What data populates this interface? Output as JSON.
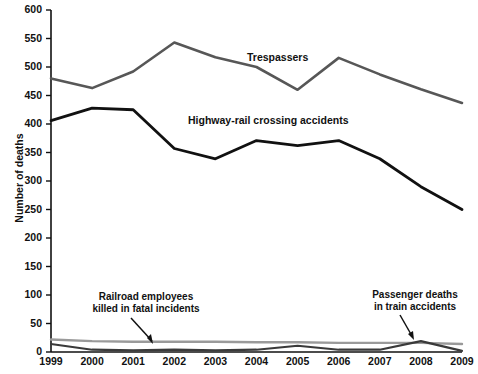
{
  "chart_data": {
    "type": "line",
    "title": "",
    "subtitle": "",
    "xlabel": "",
    "ylabel": "Number of deaths",
    "x": [
      1999,
      2000,
      2001,
      2002,
      2003,
      2004,
      2005,
      2006,
      2007,
      2008,
      2009
    ],
    "categories": [
      "1999",
      "2000",
      "2001",
      "2002",
      "2003",
      "2004",
      "2005",
      "2006",
      "2007",
      "2008",
      "2009"
    ],
    "xlim": [
      1999,
      2009
    ],
    "ylim": [
      0,
      600
    ],
    "ytick_labels": [
      "0",
      "50",
      "100",
      "150",
      "200",
      "250",
      "300",
      "350",
      "400",
      "450",
      "500",
      "550",
      "600"
    ],
    "ytick_values": [
      0,
      50,
      100,
      150,
      200,
      250,
      300,
      350,
      400,
      450,
      500,
      550,
      600
    ],
    "grid": false,
    "legend": "inline-labels",
    "series": [
      {
        "name": "Trespassers",
        "color": "#575757",
        "values": [
          480,
          463,
          492,
          543,
          517,
          500,
          460,
          516,
          487,
          461,
          437
        ],
        "label_text": "Trespassers"
      },
      {
        "name": "Highway-rail crossing accidents",
        "color": "#111111",
        "values": [
          406,
          428,
          425,
          357,
          339,
          371,
          362,
          371,
          339,
          290,
          250
        ],
        "label_text": "Highway-rail crossing accidents"
      },
      {
        "name": "Railroad employees killed in fatal incidents",
        "color": "#9a9a9a",
        "values": [
          22,
          19,
          18,
          18,
          18,
          17,
          17,
          16,
          16,
          16,
          14
        ],
        "label_text": "Railroad employees\nkilled in fatal incidents"
      },
      {
        "name": "Passenger deaths in train accidents",
        "color": "#3a3a3a",
        "values": [
          14,
          4,
          3,
          4,
          3,
          4,
          11,
          4,
          4,
          19,
          2
        ],
        "label_text": "Passenger deaths\nin train accidents"
      }
    ],
    "annotations": [
      {
        "id": "trespassers-label",
        "text": "Trespassers",
        "x_px": 247,
        "y_px": 58
      },
      {
        "id": "highway-rail-label",
        "text": "Highway-rail crossing accidents",
        "x_px": 188,
        "y_px": 121
      },
      {
        "id": "railroad-employees-callout",
        "line1": "Railroad employees",
        "line2": "killed in fatal incidents",
        "x_px": 80,
        "y_px": 297
      },
      {
        "id": "passenger-deaths-callout",
        "line1": "Passenger deaths",
        "line2": "in train accidents",
        "x_px": 363,
        "y_px": 295
      }
    ]
  },
  "axis": {
    "y_title": "Number of deaths",
    "y_ticks": [
      "600",
      "550",
      "500",
      "450",
      "400",
      "350",
      "300",
      "250",
      "200",
      "150",
      "100",
      "50",
      "0"
    ],
    "x_ticks": [
      "1999",
      "2000",
      "2001",
      "2002",
      "2003",
      "2004",
      "2005",
      "2006",
      "2007",
      "2008",
      "2009"
    ]
  },
  "labels": {
    "trespassers": "Trespassers",
    "highway_rail": "Highway-rail crossing accidents",
    "employees_line1": "Railroad employees",
    "employees_line2": "killed in fatal incidents",
    "passengers_line1": "Passenger deaths",
    "passengers_line2": "in train accidents"
  },
  "colors": {
    "trespassers": "#575757",
    "highway_rail": "#111111",
    "employees": "#9a9a9a",
    "passengers": "#3a3a3a",
    "axis": "#111111",
    "background": "#ffffff"
  }
}
